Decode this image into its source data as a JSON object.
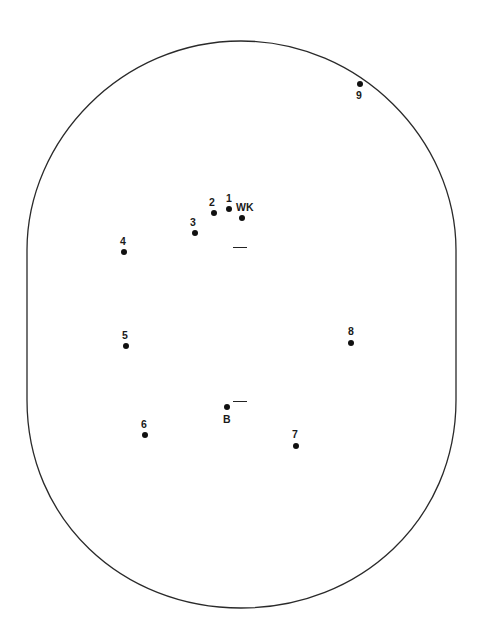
{
  "diagram": {
    "type": "cricket-field-placement",
    "boundary": {
      "left": 27,
      "right": 456,
      "top": 41,
      "bottom": 608,
      "stroke": "#2a2a2a"
    },
    "creases": [
      {
        "name": "wicketkeeper-end-crease",
        "x": 233,
        "y": 247,
        "width": 14
      },
      {
        "name": "bowler-end-crease",
        "x": 233,
        "y": 401,
        "width": 14
      }
    ],
    "fielders": [
      {
        "id": "1",
        "label": "1",
        "x": 229,
        "y": 209,
        "lx": -3,
        "ly": -16
      },
      {
        "id": "2",
        "label": "2",
        "x": 214,
        "y": 213,
        "lx": -5,
        "ly": -16
      },
      {
        "id": "wk",
        "label": "WK",
        "x": 242,
        "y": 218,
        "lx": -6,
        "ly": -16
      },
      {
        "id": "3",
        "label": "3",
        "x": 195,
        "y": 233,
        "lx": -5,
        "ly": -16
      },
      {
        "id": "4",
        "label": "4",
        "x": 124,
        "y": 252,
        "lx": -4,
        "ly": -16
      },
      {
        "id": "5",
        "label": "5",
        "x": 126,
        "y": 346,
        "lx": -4,
        "ly": -16
      },
      {
        "id": "8",
        "label": "8",
        "x": 351,
        "y": 343,
        "lx": -3,
        "ly": -17
      },
      {
        "id": "b",
        "label": "B",
        "x": 227,
        "y": 407,
        "lx": -4,
        "ly": 7
      },
      {
        "id": "6",
        "label": "6",
        "x": 145,
        "y": 435,
        "lx": -4,
        "ly": -16
      },
      {
        "id": "7",
        "label": "7",
        "x": 296,
        "y": 446,
        "lx": -4,
        "ly": -17
      },
      {
        "id": "9",
        "label": "9",
        "x": 360,
        "y": 84,
        "lx": -4,
        "ly": 6
      }
    ]
  }
}
